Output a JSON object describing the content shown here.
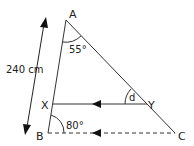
{
  "diagram": {
    "type": "geometry-triangle",
    "vertices": {
      "A": {
        "label": "A"
      },
      "B": {
        "label": "B"
      },
      "C": {
        "label": "C"
      },
      "X": {
        "label": "X"
      },
      "Y": {
        "label": "Y"
      }
    },
    "angles": {
      "at_A": "55°",
      "at_B": "80°",
      "at_Y": "d"
    },
    "measurements": {
      "AB_length": "240 cm"
    },
    "line_color": "#333333"
  }
}
